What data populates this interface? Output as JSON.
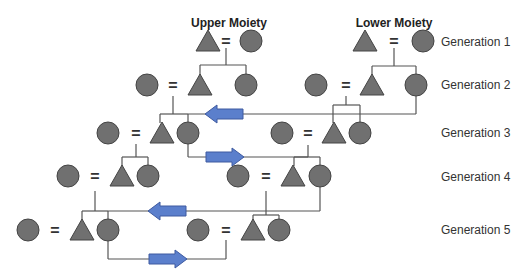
{
  "diagram": {
    "title_upper": "Upper Moiety",
    "title_lower": "Lower Moiety",
    "generations": [
      {
        "label": "Generation 1"
      },
      {
        "label": "Generation 2"
      },
      {
        "label": "Generation 3"
      },
      {
        "label": "Generation 4"
      },
      {
        "label": "Generation 5"
      }
    ],
    "marriage_symbol": "=",
    "legend": {
      "triangle": "male",
      "circle": "female",
      "equals": "marriage",
      "arrow": "marriage exchange between moieties"
    },
    "colors": {
      "figure_fill": "#707070",
      "figure_stroke": "#444444",
      "line": "#555555",
      "arrow_fill": "#5b7fcc",
      "arrow_stroke": "#3e5aa0"
    }
  }
}
